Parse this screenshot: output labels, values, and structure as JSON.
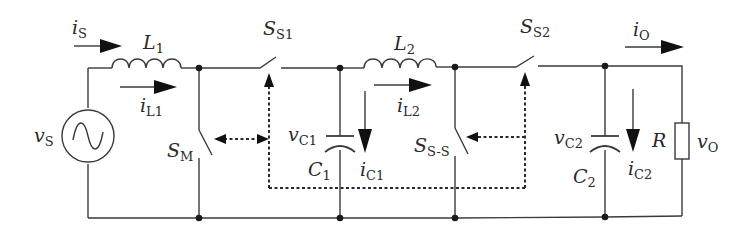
{
  "diagram": {
    "colors": {
      "line": "#3a3a3a",
      "arrow": "#111111",
      "background": "#ffffff"
    },
    "source": {
      "symbol": "v",
      "sub": "S",
      "icon": "ac-source-icon"
    },
    "source_current": {
      "symbol": "i",
      "sub": "S"
    },
    "inductor1": {
      "symbol": "L",
      "sub": "1"
    },
    "inductor1_current": {
      "symbol": "i",
      "sub": "L1"
    },
    "switch_main": {
      "symbol": "S",
      "sub": "M"
    },
    "switch_s1": {
      "symbol": "S",
      "sub": "S1"
    },
    "capacitor1": {
      "symbol": "C",
      "sub": "1"
    },
    "capacitor1_voltage": {
      "symbol": "v",
      "sub": "C1"
    },
    "capacitor1_current": {
      "symbol": "i",
      "sub": "C1"
    },
    "inductor2": {
      "symbol": "L",
      "sub": "2"
    },
    "inductor2_current": {
      "symbol": "i",
      "sub": "L2"
    },
    "switch_ss": {
      "symbol": "S",
      "sub": "S-S"
    },
    "switch_s2": {
      "symbol": "S",
      "sub": "S2"
    },
    "output_current": {
      "symbol": "i",
      "sub": "O"
    },
    "capacitor2": {
      "symbol": "C",
      "sub": "2"
    },
    "capacitor2_voltage": {
      "symbol": "v",
      "sub": "C2"
    },
    "capacitor2_current": {
      "symbol": "i",
      "sub": "C2"
    },
    "load": {
      "symbol": "R"
    },
    "output_voltage": {
      "symbol": "v",
      "sub": "O"
    }
  }
}
